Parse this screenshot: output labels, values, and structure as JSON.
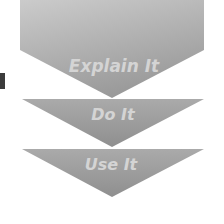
{
  "steps": [
    {
      "label": "Explain It"
    },
    {
      "label": "Do It"
    },
    {
      "label": "Use It"
    }
  ],
  "colors": {
    "shape_light": "#c4c4c4",
    "shape_dark": "#9e9e9e",
    "text": "#d6d6d6",
    "side_block": "#3c3c3c"
  }
}
